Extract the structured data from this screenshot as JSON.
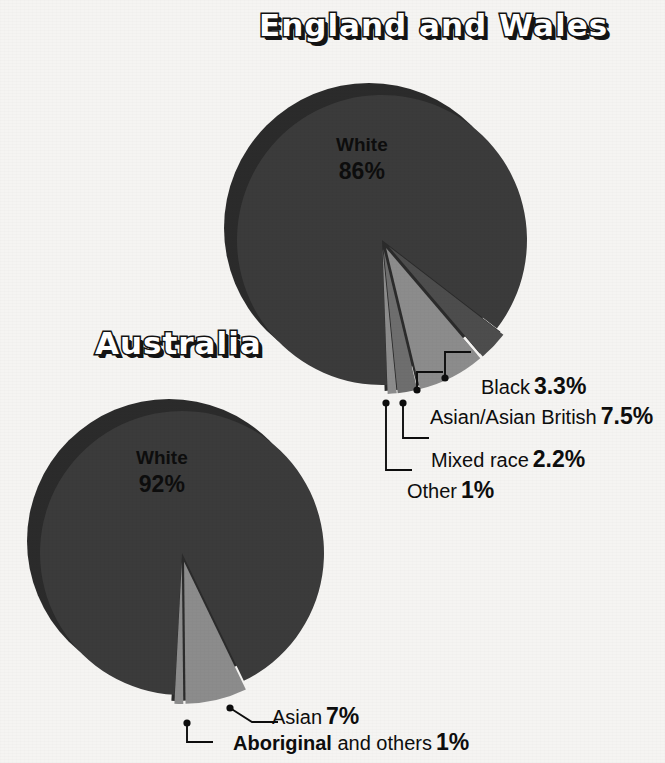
{
  "background_color": "#f5f4f2",
  "palette": {
    "shadow": "#2b2b2b",
    "major_slice": "#3b3b3b",
    "dark_slice": "#4d4d4d",
    "light_slice": "#8c8c8c",
    "mid_slice": "#6e6e6e",
    "text": "#0d0d0d",
    "title_fill": "#ffffff",
    "title_outline": "#141414"
  },
  "charts": [
    {
      "id": "england",
      "title": "England and Wales",
      "center": {
        "x": 382,
        "y": 240
      },
      "radius": 145,
      "shadow_offset": {
        "x": -13,
        "y": -12
      },
      "center_label": {
        "name": "White",
        "value": "86%"
      },
      "slices": [
        {
          "key": "white",
          "name": "White",
          "value": 86,
          "value_label": "86%",
          "color": "#3b3b3b",
          "exploded": false
        },
        {
          "key": "black",
          "name": "Black",
          "value": 3.3,
          "value_label": "3.3%",
          "color": "#4d4d4d",
          "exploded": true
        },
        {
          "key": "asian_british",
          "name": "Asian/Asian British",
          "value": 7.5,
          "value_label": "7.5%",
          "color": "#8c8c8c",
          "exploded": true
        },
        {
          "key": "mixed_race",
          "name": "Mixed race",
          "value": 2.2,
          "value_label": "2.2%",
          "color": "#6e6e6e",
          "exploded": true
        },
        {
          "key": "other",
          "name": "Other",
          "value": 1,
          "value_label": "1%",
          "color": "#8c8c8c",
          "exploded": true
        }
      ],
      "callouts": [
        {
          "key": "black",
          "name": "Black",
          "value_label": "3.3%",
          "bold_name": false,
          "dot": {
            "x": 445,
            "y": 378
          },
          "elbow": {
            "x": 445,
            "y": 352
          }
        },
        {
          "key": "asian_british",
          "name": "Asian/Asian British",
          "value_label": "7.5%",
          "bold_name": false,
          "dot": {
            "x": 417,
            "y": 390
          },
          "elbow": {
            "x": 417,
            "y": 372
          }
        },
        {
          "key": "mixed_race",
          "name": "Mixed race",
          "value_label": "2.2%",
          "bold_name": false,
          "dot": {
            "x": 403,
            "y": 403
          },
          "elbow": {
            "x": 403,
            "y": 438
          }
        },
        {
          "key": "other",
          "name": "Other",
          "value_label": "1%",
          "bold_name": false,
          "dot": {
            "x": 386,
            "y": 403
          },
          "elbow": {
            "x": 386,
            "y": 470
          }
        }
      ]
    },
    {
      "id": "australia",
      "title": "Australia",
      "center": {
        "x": 182,
        "y": 553
      },
      "radius": 142,
      "shadow_offset": {
        "x": -13,
        "y": -12
      },
      "center_label": {
        "name": "White",
        "value": "92%"
      },
      "slices": [
        {
          "key": "white",
          "name": "White",
          "value": 92,
          "value_label": "92%",
          "color": "#3b3b3b",
          "exploded": false
        },
        {
          "key": "asian",
          "name": "Asian",
          "value": 7,
          "value_label": "7%",
          "color": "#8c8c8c",
          "exploded": true
        },
        {
          "key": "aboriginal",
          "name": "Aboriginal and others",
          "value": 1,
          "value_label": "1%",
          "color": "#8c8c8c",
          "exploded": true
        }
      ],
      "callouts": [
        {
          "key": "asian",
          "name": "Asian",
          "value_label": "7%",
          "bold_name": false,
          "name_suffix": "",
          "dot": {
            "x": 230,
            "y": 708
          },
          "elbow": {
            "x": 252,
            "y": 722
          }
        },
        {
          "key": "aboriginal",
          "name": "Aboriginal",
          "value_label": "1%",
          "bold_name": true,
          "name_suffix": " and others",
          "dot": {
            "x": 187,
            "y": 723
          },
          "elbow": {
            "x": 187,
            "y": 742
          }
        }
      ]
    }
  ]
}
